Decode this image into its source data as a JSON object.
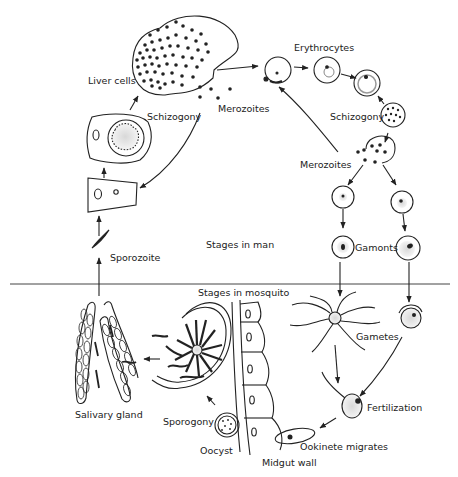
{
  "diagram": {
    "type": "life-cycle",
    "sections": {
      "upper": "Stages in man",
      "lower": "Stages in mosquito"
    },
    "labels": {
      "liver_cells": "Liver cells",
      "schizogony_liver": "Schizogony",
      "merozoites_liver": "Merozoites",
      "erythrocytes": "Erythrocytes",
      "schizogony_blood": "Schizogony",
      "merozoites_blood": "Merozoites",
      "stages_in_man": "Stages in man",
      "gamonts": "Gamonts",
      "sporozoite": "Sporozoite",
      "stages_in_mosquito": "Stages in mosquito",
      "gametes": "Gametes",
      "fertilization": "Fertilization",
      "ookinete_migrates": "Ookinete migrates",
      "midgut_wall": "Midgut wall",
      "oocyst": "Oocyst",
      "sporogony": "Sporogony",
      "salivary_gland": "Salivary gland"
    },
    "cycle_order": [
      "Sporozoite",
      "Liver cells",
      "Schizogony",
      "Merozoites",
      "Erythrocytes",
      "Schizogony",
      "Merozoites",
      "Gamonts",
      "Gametes",
      "Fertilization",
      "Ookinete migrates",
      "Oocyst",
      "Sporogony",
      "Salivary gland"
    ],
    "colors": {
      "ink": "#222222",
      "background": "#ffffff",
      "stipple": "#9a9a9a"
    }
  }
}
